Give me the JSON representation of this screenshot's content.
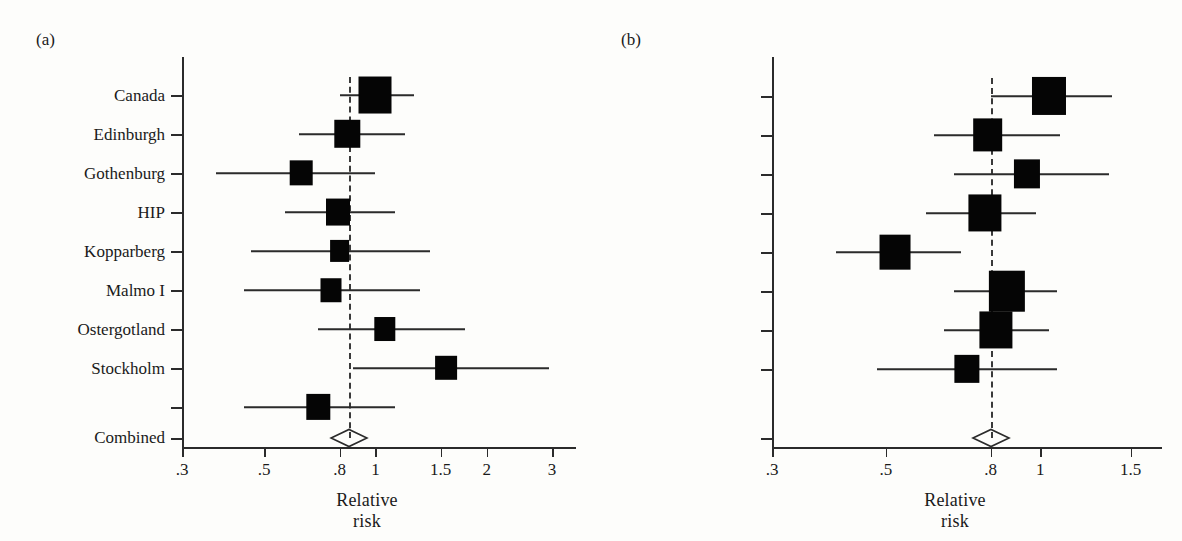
{
  "figure": {
    "panels": [
      {
        "id": "a",
        "label": "(a)",
        "xlabel": "Relative risk",
        "xticks": [
          ".3",
          ".5",
          ".8",
          "1",
          "1.5",
          "2",
          "3"
        ],
        "xtickvals": [
          0.3,
          0.5,
          0.8,
          1.0,
          1.5,
          2.0,
          3.0
        ],
        "xlim": [
          0.3,
          3.0
        ],
        "refline": 0.85,
        "studies": [
          {
            "name": "Canada",
            "rr": 1.0,
            "lo": 0.8,
            "hi": 1.27,
            "weight": 1.0
          },
          {
            "name": "Edinburgh",
            "rr": 0.84,
            "lo": 0.62,
            "hi": 1.2,
            "weight": 0.62
          },
          {
            "name": "Gothenburg",
            "rr": 0.63,
            "lo": 0.37,
            "hi": 1.0,
            "weight": 0.48
          },
          {
            "name": "HIP",
            "rr": 0.79,
            "lo": 0.57,
            "hi": 1.13,
            "weight": 0.55
          },
          {
            "name": "Kopparberg",
            "rr": 0.8,
            "lo": 0.46,
            "hi": 1.4,
            "weight": 0.34
          },
          {
            "name": "Malmo I",
            "rr": 0.76,
            "lo": 0.44,
            "hi": 1.32,
            "weight": 0.4
          },
          {
            "name": "Ostergotland",
            "rr": 1.06,
            "lo": 0.7,
            "hi": 1.75,
            "weight": 0.42
          },
          {
            "name": "Stockholm",
            "rr": 1.55,
            "lo": 0.87,
            "hi": 2.95,
            "weight": 0.44
          },
          {
            "name": "Malmo II",
            "rr": 0.7,
            "lo": 0.44,
            "hi": 1.13,
            "weight": 0.52
          }
        ],
        "combined": {
          "name": "Combined",
          "rr": 0.85,
          "lo": 0.76,
          "hi": 0.95
        }
      },
      {
        "id": "b",
        "label": "(b)",
        "xlabel": "Relative risk",
        "xticks": [
          ".3",
          ".5",
          ".8",
          "1",
          "1.5"
        ],
        "xtickvals": [
          0.3,
          0.5,
          0.8,
          1.0,
          1.5
        ],
        "xlim": [
          0.3,
          1.55
        ],
        "refline": 0.8,
        "studies": [
          {
            "name": "Canada",
            "rr": 1.04,
            "lo": 0.8,
            "hi": 1.38,
            "weight": 0.82
          },
          {
            "name": "Edinburgh",
            "rr": 0.79,
            "lo": 0.62,
            "hi": 1.09,
            "weight": 0.62
          },
          {
            "name": "Gothenburg",
            "rr": 0.94,
            "lo": 0.68,
            "hi": 1.36,
            "weight": 0.46
          },
          {
            "name": "HIP",
            "rr": 0.78,
            "lo": 0.6,
            "hi": 0.98,
            "weight": 0.78
          },
          {
            "name": "Kopparberg",
            "rr": 0.52,
            "lo": 0.4,
            "hi": 0.7,
            "weight": 0.68
          },
          {
            "name": "Malmo I",
            "rr": 0.86,
            "lo": 0.68,
            "hi": 1.08,
            "weight": 0.92
          },
          {
            "name": "Ostergotland",
            "rr": 0.82,
            "lo": 0.65,
            "hi": 1.04,
            "weight": 0.78
          },
          {
            "name": "Stockholm",
            "rr": 0.72,
            "lo": 0.48,
            "hi": 1.08,
            "weight": 0.42
          }
        ],
        "combined": {
          "name": "Combined",
          "rr": 0.8,
          "lo": 0.74,
          "hi": 0.87
        }
      }
    ]
  },
  "style": {
    "marker_color": "#050505",
    "axis_color": "#2b2b2b",
    "refline_color": "#3a3a3a",
    "background": "#fdfdfb"
  }
}
